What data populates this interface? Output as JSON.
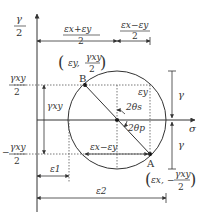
{
  "diagram": {
    "axes": {
      "vertical_label_num": "γ",
      "vertical_label_den": "2",
      "horizontal_label": "σ"
    },
    "points": {
      "B": {
        "label": "B",
        "coord_x": "(ε",
        "coord_x_sub": "y",
        "coord_num": "γ",
        "coord_num_sub": "xy",
        "coord_den": "2"
      },
      "A": {
        "label": "A",
        "coord_x": "(ε",
        "coord_x_sub": "x",
        "coord_num": "γ",
        "coord_num_sub": "xy",
        "coord_den": "2",
        "sign": "−"
      }
    },
    "dimensions": {
      "top_left_num": "εx+εy",
      "top_left_den": "2",
      "top_right_num": "εx−εy",
      "top_right_den": "2",
      "left_upper_num": "γxy",
      "left_upper_den": "2",
      "left_mid": "γxy",
      "left_lower_num": "γxy",
      "left_lower_den": "2",
      "left_lower_sign": "−",
      "eps1": "ε1",
      "eps2": "ε2",
      "diameter_horizontal": "εx−εy",
      "eps_y_inner": "εy",
      "right_gamma_upper": "γ",
      "right_gamma_lower": "γ"
    },
    "angles": {
      "two_theta_s": "2θs",
      "two_theta_p": "2θp"
    }
  }
}
